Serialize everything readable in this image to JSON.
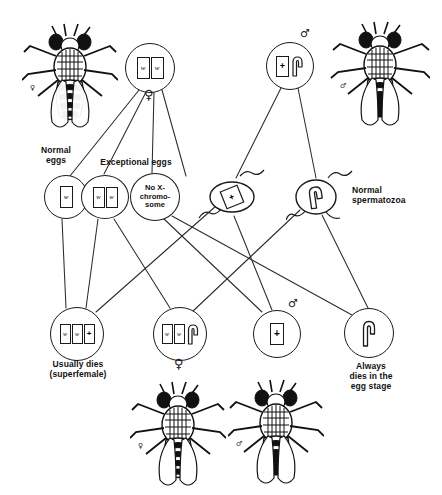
{
  "diagram": {
    "line_color": "#2b2b2b",
    "ink_color": "#1a1a1a"
  },
  "parents": {
    "mother": {
      "id": "mother-white-eyed-female",
      "chromosomes": [
        "w",
        "w"
      ],
      "sex_symbol": "♀",
      "cx": 150,
      "cy": 68,
      "r": 25
    },
    "father": {
      "id": "father-red-eyed-male",
      "chromosomes": [
        "+",
        "Y"
      ],
      "sex_symbol": "♂",
      "cx": 290,
      "cy": 66,
      "r": 24
    }
  },
  "flies": [
    {
      "name": "mother-fly",
      "sex_symbol": "♀",
      "x": 22,
      "y": 22,
      "w": 96,
      "h": 112
    },
    {
      "name": "father-fly",
      "sex_symbol": "♂",
      "x": 330,
      "y": 20,
      "w": 100,
      "h": 112
    },
    {
      "name": "daughter-fly",
      "sex_symbol": "♀",
      "x": 130,
      "y": 380,
      "w": 96,
      "h": 112
    },
    {
      "name": "son-fly",
      "sex_symbol": "♂",
      "x": 228,
      "y": 378,
      "w": 96,
      "h": 112
    }
  ],
  "egg_group_labels": [
    {
      "name": "normal-eggs-label",
      "text": "Normal\neggs",
      "x": 26,
      "y": 146,
      "w": 60
    },
    {
      "name": "exceptional-eggs-label",
      "text": "Exceptional eggs",
      "x": 86,
      "y": 158,
      "w": 100
    }
  ],
  "sperm_group_labels": [
    {
      "name": "normal-spermatozoa-label",
      "text": "Normal\nspermatozoa",
      "x": 352,
      "y": 186,
      "w": 86
    }
  ],
  "gametes": [
    {
      "name": "egg-normal-w",
      "kind": "egg",
      "chromosomes": [
        "w"
      ],
      "text": null,
      "cx": 66,
      "cy": 197,
      "rx": 22,
      "ry": 22
    },
    {
      "name": "egg-exceptional-ww",
      "kind": "egg",
      "chromosomes": [
        "w",
        "w"
      ],
      "text": null,
      "cx": 105,
      "cy": 197,
      "rx": 24,
      "ry": 22
    },
    {
      "name": "egg-exceptional-nullo-x",
      "kind": "egg",
      "chromosomes": [],
      "text": "No X-\nchromo-\nsome",
      "cx": 155,
      "cy": 197,
      "rx": 25,
      "ry": 24
    },
    {
      "name": "sperm-x-plus",
      "kind": "sperm",
      "chromosomes": [
        "+"
      ],
      "text": null,
      "cx": 232,
      "cy": 197,
      "rx": 22,
      "ry": 18
    },
    {
      "name": "sperm-y",
      "kind": "sperm",
      "chromosomes": [
        "Y"
      ],
      "text": null,
      "cx": 314,
      "cy": 197,
      "rx": 21,
      "ry": 19
    }
  ],
  "offspring": [
    {
      "name": "offspring-superfemale",
      "chromosomes": [
        "w",
        "w",
        "+"
      ],
      "sex_symbol": null,
      "cx": 77,
      "cy": 334,
      "r": 27,
      "label": "Usually dies\n(superfemale)",
      "label_x": 14,
      "label_y": 360,
      "label_w": 128
    },
    {
      "name": "offspring-white-eyed-female",
      "chromosomes": [
        "w",
        "w",
        "Y"
      ],
      "sex_symbol": "♀",
      "cx": 180,
      "cy": 334,
      "r": 27,
      "label": null,
      "label_x": 0,
      "label_y": 0,
      "label_w": 0
    },
    {
      "name": "offspring-red-eyed-male",
      "chromosomes": [
        "+"
      ],
      "sex_symbol": "♂",
      "cx": 277,
      "cy": 334,
      "r": 24,
      "label": null,
      "label_x": 0,
      "label_y": 0,
      "label_w": 0
    },
    {
      "name": "offspring-yo-dies",
      "chromosomes": [
        "Y"
      ],
      "sex_symbol": null,
      "cx": 369,
      "cy": 333,
      "r": 25,
      "label": "Always\ndies in the\negg stage",
      "label_x": 326,
      "label_y": 362,
      "label_w": 90
    }
  ],
  "connections": [
    {
      "from": "mother",
      "to": "egg-normal-w"
    },
    {
      "from": "mother",
      "to": "egg-exceptional-ww"
    },
    {
      "from": "mother",
      "to": "egg-exceptional-nullo-x"
    },
    {
      "from": "mother",
      "to": "egg-spare-column"
    },
    {
      "from": "father",
      "to": "sperm-x-plus"
    },
    {
      "from": "father",
      "to": "sperm-y"
    },
    {
      "from": "egg-normal-w",
      "to": "offspring-superfemale"
    },
    {
      "from": "egg-exceptional-ww",
      "to": "offspring-superfemale"
    },
    {
      "from": "egg-exceptional-ww",
      "to": "offspring-white-eyed-female"
    },
    {
      "from": "egg-exceptional-nullo-x",
      "to": "offspring-red-eyed-male"
    },
    {
      "from": "egg-exceptional-nullo-x",
      "to": "offspring-yo-dies"
    },
    {
      "from": "sperm-x-plus",
      "to": "offspring-superfemale"
    },
    {
      "from": "sperm-x-plus",
      "to": "offspring-red-eyed-male"
    },
    {
      "from": "sperm-y",
      "to": "offspring-white-eyed-female"
    },
    {
      "from": "sperm-y",
      "to": "offspring-yo-dies"
    }
  ]
}
